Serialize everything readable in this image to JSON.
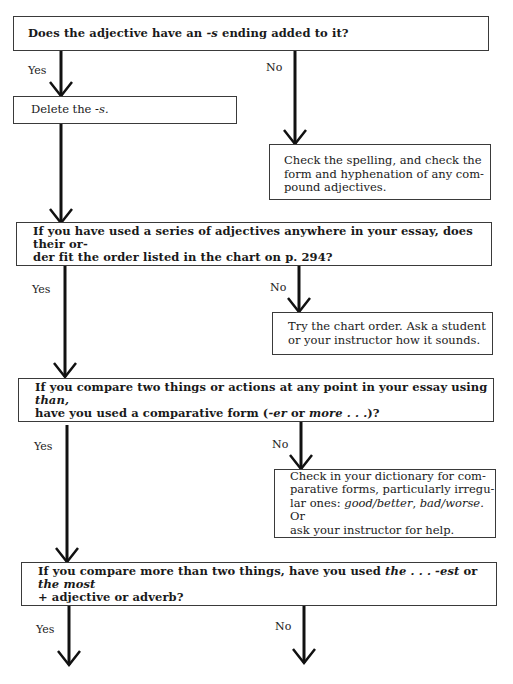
{
  "flowchart": {
    "questions": [
      {
        "id": "q1",
        "parts": [
          {
            "t": "Does the adjective have an ",
            "i": false
          },
          {
            "t": "-s",
            "i": true
          },
          {
            "t": " ending added to it?",
            "i": false
          }
        ]
      },
      {
        "id": "q2",
        "lines": [
          "If you have used a series of adjectives anywhere in your essay, does their or-",
          "der fit the order listed in the chart on p. 294?"
        ]
      },
      {
        "id": "q3",
        "line1": [
          {
            "t": "If you compare two things or actions at any point in your essay using ",
            "i": false
          },
          {
            "t": "than,",
            "i": true
          }
        ],
        "line2": [
          {
            "t": "have you used a comparative form (",
            "i": false
          },
          {
            "t": "-er",
            "i": true
          },
          {
            "t": " or ",
            "i": false
          },
          {
            "t": "more . . .",
            "i": true
          },
          {
            "t": ")?",
            "i": false
          }
        ]
      },
      {
        "id": "q4",
        "line1": [
          {
            "t": "If you compare more than two things, have you used ",
            "i": false
          },
          {
            "t": "the . . . -est",
            "i": true
          },
          {
            "t": " or ",
            "i": false
          },
          {
            "t": "the most",
            "i": true
          }
        ],
        "line2": [
          {
            "t": "+ adjective or adverb?",
            "i": false
          }
        ]
      }
    ],
    "answers": {
      "a1_yes": [
        {
          "t": "Delete the ",
          "i": false
        },
        {
          "t": "-s.",
          "i": true
        }
      ],
      "a1_no": [
        "Check the spelling, and check the",
        "form and hyphenation of any com-",
        "pound adjectives."
      ],
      "a2_no": [
        "Try the chart order. Ask a student",
        "or your instructor how it sounds."
      ],
      "a3_no": {
        "line1": "Check in your dictionary for com-",
        "line2": "parative forms, particularly irregu-",
        "line3": [
          {
            "t": "lar ones: ",
            "i": false
          },
          {
            "t": "good/better",
            "i": true
          },
          {
            "t": ", ",
            "i": false
          },
          {
            "t": "bad/worse.",
            "i": true
          },
          {
            "t": " Or",
            "i": false
          }
        ],
        "line4": "ask your instructor for help."
      }
    },
    "labels": {
      "yes": "Yes",
      "no": "No"
    }
  }
}
